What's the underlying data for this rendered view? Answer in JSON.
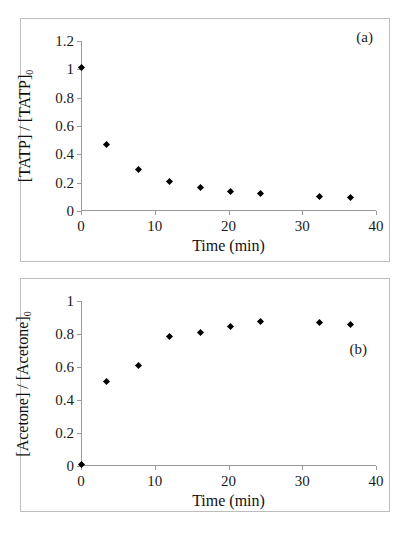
{
  "figure": {
    "background": "#ffffff",
    "marker_color": "#000000",
    "axis_color": "#9a9a9a",
    "frame_color": "#bdbdbd"
  },
  "panels": [
    {
      "tag": "(a)",
      "xlabel": "Time (min)",
      "ylabel_main": "[TATP] / [TATP]",
      "ylabel_sub": "0",
      "xticks": [
        "0",
        "10",
        "20",
        "30",
        "40"
      ],
      "yticks": [
        "0",
        "0.2",
        "0.4",
        "0.6",
        "0.8",
        "1",
        "1.2"
      ]
    },
    {
      "tag": "(b)",
      "xlabel": "Time (min)",
      "ylabel_main": "[Acetone] / [Acetone]",
      "ylabel_sub": "0",
      "xticks": [
        "0",
        "10",
        "20",
        "30",
        "40"
      ],
      "yticks": [
        "0",
        "0.2",
        "0.4",
        "0.6",
        "0.8",
        "1"
      ]
    }
  ],
  "chart_data": [
    {
      "type": "scatter",
      "title": "",
      "annotation": "(a)",
      "xlabel": "Time (min)",
      "ylabel": "[TATP] / [TATP]0",
      "xlim": [
        0,
        40
      ],
      "ylim": [
        0,
        1.2
      ],
      "xticks": [
        0,
        10,
        20,
        30,
        40
      ],
      "yticks": [
        0,
        0.2,
        0.4,
        0.6,
        0.8,
        1,
        1.2
      ],
      "grid": false,
      "legend": null,
      "marker": "diamond",
      "marker_color": "#000000",
      "x": [
        0,
        3.5,
        7.8,
        12.0,
        16.2,
        20.3,
        24.3,
        32.3,
        36.5
      ],
      "y": [
        1.01,
        0.47,
        0.295,
        0.21,
        0.165,
        0.14,
        0.125,
        0.105,
        0.095
      ]
    },
    {
      "type": "scatter",
      "title": "",
      "annotation": "(b)",
      "xlabel": "Time (min)",
      "ylabel": "[Acetone] / [Acetone]0",
      "xlim": [
        0,
        40
      ],
      "ylim": [
        0,
        1
      ],
      "xticks": [
        0,
        10,
        20,
        30,
        40
      ],
      "yticks": [
        0,
        0.2,
        0.4,
        0.6,
        0.8,
        1
      ],
      "grid": false,
      "legend": null,
      "marker": "diamond",
      "marker_color": "#000000",
      "x": [
        0,
        3.5,
        7.8,
        12.0,
        16.2,
        20.3,
        24.3,
        32.3,
        36.5
      ],
      "y": [
        0.01,
        0.51,
        0.61,
        0.785,
        0.81,
        0.845,
        0.875,
        0.87,
        0.86
      ]
    }
  ]
}
